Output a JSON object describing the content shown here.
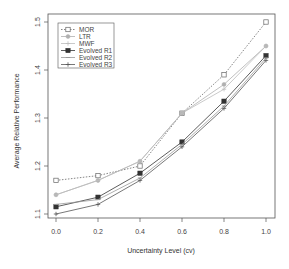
{
  "chart_data": {
    "type": "line",
    "title": "",
    "xlabel": "Uncertainty Level (cv)",
    "ylabel": "Average Relative Performance",
    "x": [
      0.0,
      0.2,
      0.4,
      0.6,
      0.8,
      1.0
    ],
    "x_tick_labels": [
      "0.0",
      "0.2",
      "0.4",
      "0.6",
      "0.8",
      "1.0"
    ],
    "y_ticks": [
      1.1,
      1.2,
      1.3,
      1.4,
      1.5
    ],
    "y_tick_labels": [
      "1.1",
      "1.2",
      "1.3",
      "1.4",
      "1.5"
    ],
    "xlim": [
      0.0,
      1.0
    ],
    "ylim": [
      1.09,
      1.51
    ],
    "grid": false,
    "legend_position": "top-left",
    "series": [
      {
        "name": "MOR",
        "marker": "open-square",
        "line": "dotted",
        "color": "#666666",
        "values": [
          1.17,
          1.18,
          1.2,
          1.31,
          1.39,
          1.5
        ]
      },
      {
        "name": "LTR",
        "marker": "circle",
        "line": "solid",
        "color": "#b0b0b0",
        "values": [
          1.14,
          1.17,
          1.21,
          1.31,
          1.37,
          1.45
        ]
      },
      {
        "name": "MWF",
        "marker": "plus",
        "line": "solid",
        "color": "#bdbdbd",
        "values": [
          1.14,
          1.17,
          1.21,
          1.31,
          1.36,
          1.45
        ]
      },
      {
        "name": "Evolved R1",
        "marker": "filled-square",
        "line": "solid",
        "color": "#333333",
        "values": [
          1.115,
          1.135,
          1.185,
          1.25,
          1.335,
          1.43
        ]
      },
      {
        "name": "Evolved R2",
        "marker": "dash",
        "line": "solid",
        "color": "#999999",
        "values": [
          1.12,
          1.13,
          1.175,
          1.245,
          1.325,
          1.425
        ]
      },
      {
        "name": "Evolved R3",
        "marker": "plus",
        "line": "solid",
        "color": "#555555",
        "values": [
          1.1,
          1.12,
          1.17,
          1.24,
          1.32,
          1.42
        ]
      }
    ]
  },
  "legend": {
    "items": [
      "MOR",
      "LTR",
      "MWF",
      "Evolved R1",
      "Evolved R2",
      "Evolved R3"
    ]
  }
}
